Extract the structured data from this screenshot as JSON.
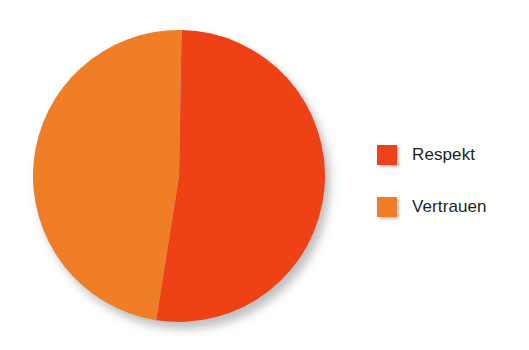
{
  "chart_data": {
    "type": "pie",
    "title": "",
    "subtitle": "",
    "xlabel": "",
    "ylabel": "",
    "grid": false,
    "legend_position": "right",
    "categories": [
      "Respekt",
      "Vertrauen"
    ],
    "values": [
      52,
      48
    ],
    "slices": [
      {
        "label": "Respekt",
        "value": 52,
        "color": "#ee4318",
        "start_angle_deg": 1,
        "end_angle_deg": 189
      },
      {
        "label": "Vertrauen",
        "value": 48,
        "color": "#f07e28",
        "start_angle_deg": 189,
        "end_angle_deg": 361
      }
    ]
  },
  "legend": {
    "items": [
      {
        "label": "Respekt",
        "color": "#ee4318",
        "swatch_name": "legend-swatch-respekt"
      },
      {
        "label": "Vertrauen",
        "color": "#f07e28",
        "swatch_name": "legend-swatch-vertrauen"
      }
    ]
  },
  "colors": {
    "respekt": "#ee4318",
    "vertrauen": "#f07e28",
    "text": "#231f20",
    "background": "#ffffff",
    "shadow": "#9a9a9a"
  }
}
